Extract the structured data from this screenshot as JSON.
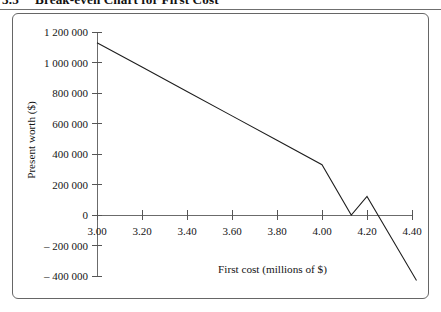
{
  "figure": {
    "number": "3.5",
    "caption": "Break-even Chart for First Cost"
  },
  "chart_data": {
    "type": "line",
    "title": "Break-even Chart for First Cost",
    "xlabel": "First cost (millions of $)",
    "ylabel": "Present worth ($)",
    "xlim": [
      3.0,
      4.4
    ],
    "ylim": [
      -400000,
      1200000
    ],
    "grid": false,
    "legend": null,
    "xticks": [
      3.0,
      3.2,
      3.4,
      3.6,
      3.8,
      4.0,
      4.2,
      4.4
    ],
    "xtick_labels": [
      "3.00",
      "3.20",
      "3.40",
      "3.60",
      "3.80",
      "4.00",
      "4.20",
      "4.40"
    ],
    "yticks": [
      1200000,
      1000000,
      800000,
      600000,
      400000,
      200000,
      0,
      -200000,
      -400000
    ],
    "ytick_labels": [
      "1 200 000",
      "1 000 000",
      "800 000",
      "600 000",
      "400 000",
      "200 000",
      "0",
      "– 200 000",
      "– 400 000"
    ],
    "series": [
      {
        "name": "Present worth",
        "color": "#1d1d1d",
        "x": [
          3.0,
          3.2,
          3.4,
          3.6,
          3.8,
          4.0,
          4.13,
          4.2,
          4.42
        ],
        "values": [
          1130000,
          970000,
          810000,
          650000,
          490000,
          330000,
          0,
          122000,
          -430000
        ]
      }
    ],
    "annotations": [
      {
        "text": "break-even at first cost ≈ 4.13 million $",
        "x": 4.13,
        "y": 0
      }
    ]
  }
}
